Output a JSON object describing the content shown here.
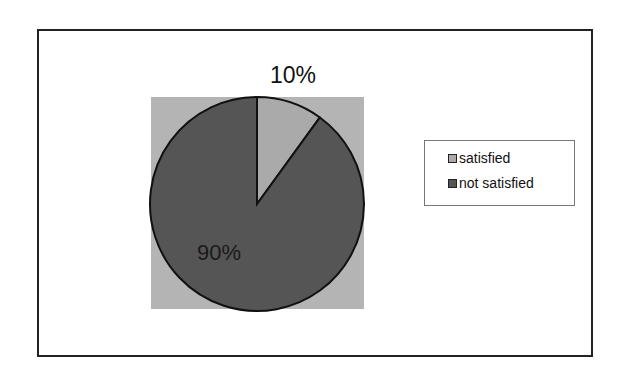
{
  "chart_data": {
    "type": "pie",
    "title": "",
    "categories": [
      "satisfied",
      "not satisfied"
    ],
    "values": [
      10,
      90
    ],
    "unit": "%",
    "data_labels": [
      "10%",
      "90%"
    ],
    "colors": [
      "#aaaaaa",
      "#555555"
    ],
    "legend_position": "right",
    "start_angle_deg": 0,
    "direction": "clockwise"
  },
  "legend": {
    "items": [
      {
        "label": "satisfied",
        "color": "#aaaaaa"
      },
      {
        "label": "not satisfied",
        "color": "#555555"
      }
    ]
  },
  "labels": {
    "satisfied": "10%",
    "not_satisfied": "90%"
  },
  "colors": {
    "plot_background": "#b4b4b4",
    "frame_border": "#222222"
  }
}
